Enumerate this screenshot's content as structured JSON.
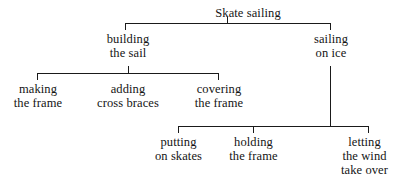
{
  "diagram": {
    "type": "tree",
    "title_text": "Skate sailing",
    "orientation": "top-down",
    "line_color": "#1a1a1a",
    "text_color": "#141414",
    "background_color": "#ffffff",
    "root": {
      "label": "Skate sailing",
      "children": [
        {
          "label": "building\nthe sail",
          "children": [
            {
              "label": "making\nthe frame",
              "children": []
            },
            {
              "label": "adding\ncross braces",
              "children": []
            },
            {
              "label": "covering\nthe frame",
              "children": []
            }
          ]
        },
        {
          "label": "sailing\non ice",
          "children": [
            {
              "label": "putting\non skates",
              "children": []
            },
            {
              "label": "holding\nthe frame",
              "children": []
            },
            {
              "label": "letting\nthe wind\ntake over",
              "children": []
            }
          ]
        }
      ]
    },
    "nodes": {
      "root": "Skate sailing",
      "building_the_sail": "building\nthe sail",
      "sailing_on_ice": "sailing\non ice",
      "making_the_frame": "making\nthe frame",
      "adding_cross_braces": "adding\ncross braces",
      "covering_the_frame": "covering\nthe frame",
      "putting_on_skates": "putting\non skates",
      "holding_the_frame": "holding\nthe frame",
      "letting_the_wind_take_over": "letting\nthe wind\ntake over"
    }
  }
}
